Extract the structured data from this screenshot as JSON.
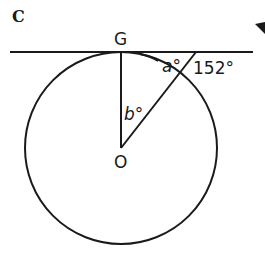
{
  "panel_label": "C",
  "points": {
    "G": "G",
    "O": "O"
  },
  "angles": {
    "a": "a°",
    "known": "152°",
    "b": "b°"
  },
  "colors": {
    "stroke": "#1a1a1a",
    "background": "#ffffff"
  },
  "geometry": {
    "circle": {
      "cx": 121,
      "cy": 148,
      "r": 96
    },
    "tangent_line": {
      "x1": 10,
      "y1": 52,
      "x2": 253,
      "y2": 52
    },
    "radius_OG": {
      "x1": 121,
      "y1": 52,
      "x2": 121,
      "y2": 148
    },
    "secant_line": {
      "x1": 121,
      "y1": 148,
      "x2": 196,
      "y2": 52
    }
  }
}
